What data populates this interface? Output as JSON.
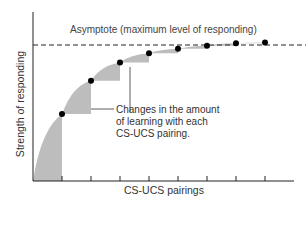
{
  "chart_data": {
    "type": "line",
    "title": "",
    "xlabel": "CS-UCS pairings",
    "ylabel": "Strength of responding",
    "x": [
      1,
      2,
      3,
      4,
      5,
      6,
      7,
      8
    ],
    "series": [
      {
        "name": "Strength of responding",
        "values": [
          0.44,
          0.66,
          0.78,
          0.84,
          0.87,
          0.89,
          0.905,
          0.91
        ]
      }
    ],
    "asymptote": {
      "value": 0.9,
      "label": "Asymptote (maximum level of responding)",
      "style": "dashed"
    },
    "annotations": [
      {
        "text": [
          "Changes in the amount",
          "of learning with each",
          "CS-UCS pairing."
        ],
        "points_to": "shaded increments"
      }
    ],
    "ylim": [
      0,
      1
    ],
    "xlim": [
      0,
      9
    ],
    "grid": false,
    "legend": "none",
    "colors": {
      "line": "#000000",
      "shade": "#bdbdbd",
      "points": "#000000"
    }
  },
  "labels": {
    "asymptote": "Asymptote (maximum level of responding)",
    "note_line1": "Changes in the amount",
    "note_line2": "of learning with each",
    "note_line3": "CS-UCS pairing.",
    "xlabel": "CS-UCS pairings",
    "ylabel": "Strength of responding"
  }
}
